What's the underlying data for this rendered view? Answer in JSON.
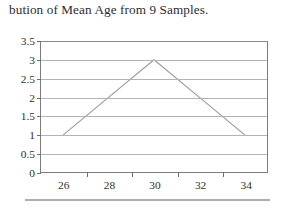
{
  "document": {
    "title_text": "bution of Mean Age from 9 Samples.",
    "rule_label": "page-rule"
  },
  "chart_data": {
    "type": "line",
    "title": "bution of Mean Age from 9 Samples.",
    "xlabel": "",
    "ylabel": "",
    "categories": [
      "26",
      "28",
      "30",
      "32",
      "34"
    ],
    "x": [
      26,
      28,
      30,
      32,
      34
    ],
    "values": [
      1,
      2,
      3,
      2,
      1
    ],
    "series": [
      {
        "name": "Distribution of Mean Age",
        "values": [
          1,
          2,
          3,
          2,
          1
        ]
      }
    ],
    "ylim": [
      0,
      3.5
    ],
    "ytick_labels": [
      "0",
      "0.5",
      "1",
      "1.5",
      "2",
      "2.5",
      "3",
      "3.5"
    ],
    "ytick_values": [
      0,
      0.5,
      1,
      1.5,
      2,
      2.5,
      3,
      3.5
    ],
    "xtick_labels": [
      "26",
      "28",
      "30",
      "32",
      "34"
    ],
    "grid": "horizontal",
    "legend": "none",
    "line_color": "#9a9a9a",
    "axis_color": "#7c7c7c",
    "grid_color": "#b4b4b4"
  }
}
